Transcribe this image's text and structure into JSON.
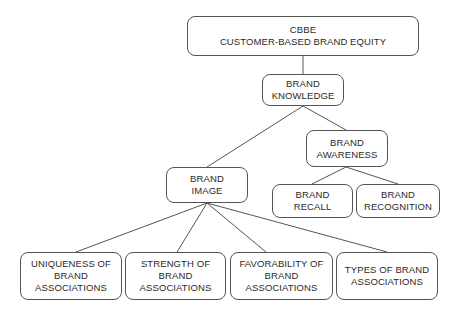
{
  "diagram": {
    "title": "CBBE Customer-Based Brand Equity",
    "nodes": {
      "cbbe": {
        "lines": [
          "CBBE",
          "CUSTOMER-BASED BRAND EQUITY"
        ]
      },
      "knowledge": {
        "lines": [
          "BRAND",
          "KNOWLEDGE"
        ]
      },
      "awareness": {
        "lines": [
          "BRAND",
          "AWARENESS"
        ]
      },
      "image": {
        "lines": [
          "BRAND",
          "IMAGE"
        ]
      },
      "recall": {
        "lines": [
          "BRAND",
          "RECALL"
        ]
      },
      "recognition": {
        "lines": [
          "BRAND",
          "RECOGNITION"
        ]
      },
      "uniqueness": {
        "lines": [
          "UNIQUENESS OF",
          "BRAND",
          "ASSOCIATIONS"
        ]
      },
      "strength": {
        "lines": [
          "STRENGTH OF",
          "BRAND",
          "ASSOCIATIONS"
        ]
      },
      "favorability": {
        "lines": [
          "FAVORABILITY OF",
          "BRAND",
          "ASSOCIATIONS"
        ]
      },
      "types": {
        "lines": [
          "TYPES OF BRAND",
          "ASSOCIATIONS"
        ]
      }
    },
    "edges": [
      [
        "cbbe",
        "knowledge"
      ],
      [
        "knowledge",
        "image"
      ],
      [
        "knowledge",
        "awareness"
      ],
      [
        "awareness",
        "recall"
      ],
      [
        "awareness",
        "recognition"
      ],
      [
        "image",
        "uniqueness"
      ],
      [
        "image",
        "strength"
      ],
      [
        "image",
        "favorability"
      ],
      [
        "image",
        "types"
      ]
    ]
  }
}
